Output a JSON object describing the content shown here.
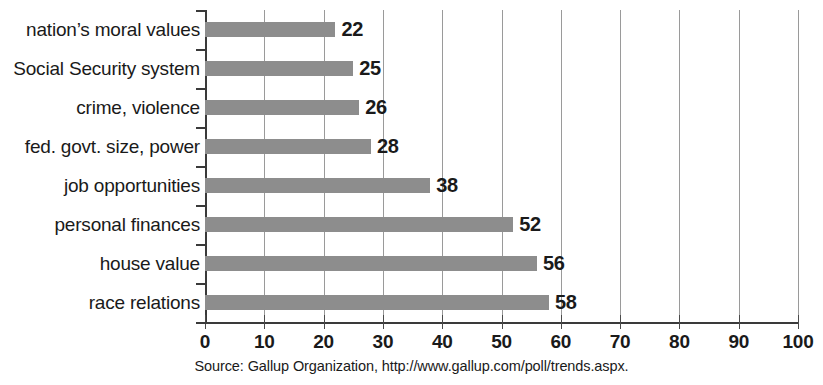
{
  "chart_data": {
    "type": "bar",
    "orientation": "horizontal",
    "title": "",
    "subtitle": "",
    "xlabel": "",
    "ylabel": "",
    "xlim": [
      0,
      100
    ],
    "xticks": [
      "0",
      "10",
      "20",
      "30",
      "40",
      "50",
      "60",
      "70",
      "80",
      "90",
      "100"
    ],
    "xtick_step": 10,
    "grid": "vertical",
    "legend": "none",
    "categories": [
      "nation’s moral values",
      "Social Security system",
      "crime, violence",
      "fed. govt. size, power",
      "job opportunities",
      "personal finances",
      "house value",
      "race relations"
    ],
    "values": [
      22,
      25,
      26,
      28,
      38,
      52,
      56,
      58
    ],
    "value_labels": [
      "22",
      "25",
      "26",
      "28",
      "38",
      "52",
      "56",
      "58"
    ],
    "bar_color": "#8d8d8d",
    "axis_color": "#3a3a3a",
    "gridline_color": "#9a9a9a"
  },
  "source": {
    "note": "Source: Gallup Organization, http://www.gallup.com/poll/trends.aspx."
  }
}
